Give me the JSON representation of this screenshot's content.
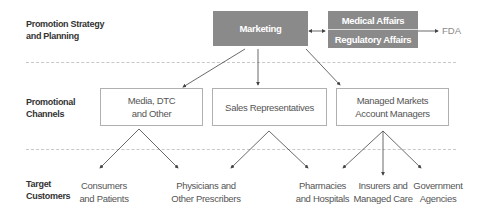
{
  "rows": {
    "strategy": "Promotion Strategy and Planning",
    "strategy_l1": "Promotion Strategy",
    "strategy_l2": "and Planning",
    "channels_l1": "Promotional",
    "channels_l2": "Channels",
    "targets_l1": "Target",
    "targets_l2": "Customers"
  },
  "top": {
    "marketing": "Marketing",
    "medical_affairs": "Medical Affairs",
    "regulatory_affairs": "Regulatory Affairs",
    "fda": "FDA"
  },
  "channels": [
    {
      "l1": "Media, DTC",
      "l2": "and Other"
    },
    {
      "l1": "Sales Representatives",
      "l2": ""
    },
    {
      "l1": "Managed Markets",
      "l2": "Account Managers"
    }
  ],
  "targets": [
    {
      "l1": "Consumers",
      "l2": "and Patients"
    },
    {
      "l1": "Physicians and",
      "l2": "Other Prescribers"
    },
    {
      "l1": "Pharmacies",
      "l2": "and Hospitals"
    },
    {
      "l1": "Insurers and",
      "l2": "Managed Care"
    },
    {
      "l1": "Government",
      "l2": "Agencies"
    }
  ],
  "colors": {
    "gray_box": "#8a8a8a",
    "line": "#444444",
    "dash": "#c8c8c8"
  }
}
